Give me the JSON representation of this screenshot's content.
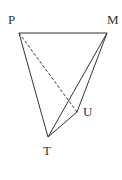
{
  "diagram": {
    "type": "geometry-tetrahedron",
    "stroke_color": "#333333",
    "background": "#ffffff",
    "points": {
      "P": {
        "label": "P",
        "x": 19,
        "y": 33
      },
      "M": {
        "label": "M",
        "x": 107,
        "y": 33
      },
      "T": {
        "label": "T",
        "x": 48,
        "y": 137
      },
      "U": {
        "label": "U",
        "x": 77,
        "y": 112
      }
    },
    "edges": [
      {
        "from": "P",
        "to": "M",
        "style": "solid"
      },
      {
        "from": "P",
        "to": "T",
        "style": "solid"
      },
      {
        "from": "M",
        "to": "T",
        "style": "solid"
      },
      {
        "from": "M",
        "to": "U",
        "style": "solid"
      },
      {
        "from": "T",
        "to": "U",
        "style": "solid"
      },
      {
        "from": "P",
        "to": "U",
        "style": "dashed"
      }
    ]
  }
}
